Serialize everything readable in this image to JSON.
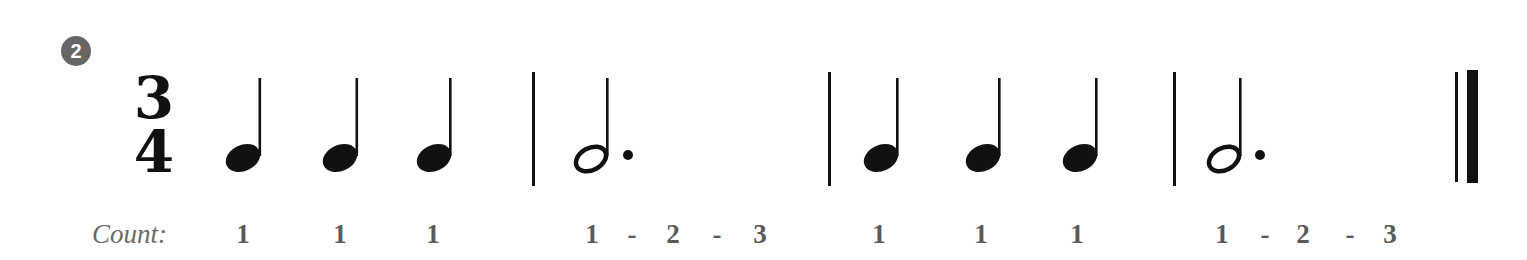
{
  "exercise": {
    "number": "2",
    "time_signature": {
      "numerator": "3",
      "denominator": "4"
    },
    "count_label": "Count:",
    "measures": [
      {
        "notes": [
          "quarter",
          "quarter",
          "quarter"
        ],
        "counts": [
          "1",
          "1",
          "1"
        ]
      },
      {
        "notes": [
          "dotted-half"
        ],
        "counts": [
          "1",
          "-",
          "2",
          "-",
          "3"
        ]
      },
      {
        "notes": [
          "quarter",
          "quarter",
          "quarter"
        ],
        "counts": [
          "1",
          "1",
          "1"
        ]
      },
      {
        "notes": [
          "dotted-half"
        ],
        "counts": [
          "1",
          "-",
          "2",
          "-",
          "3"
        ]
      }
    ],
    "final_barline": "double-final"
  },
  "counts_flat": [
    "1",
    "1",
    "1",
    "1",
    "-",
    "2",
    "-",
    "3",
    "1",
    "1",
    "1",
    "1",
    "-",
    "2",
    "-",
    "3"
  ],
  "colors": {
    "ink": "#111111",
    "badge": "#666666",
    "count_text": "#5a5a5a"
  }
}
